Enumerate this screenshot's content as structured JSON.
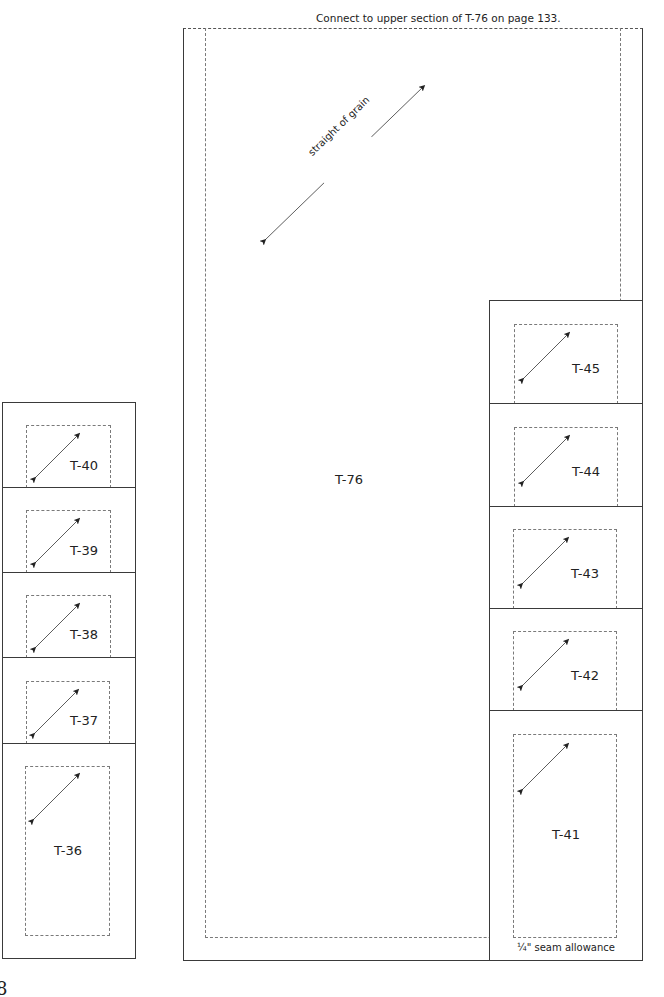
{
  "header_note": "Connect to upper section of T-76 on page 133.",
  "main_piece": {
    "label": "T-76",
    "grain_label": "straight of grain"
  },
  "right_column": [
    {
      "label": "T-45"
    },
    {
      "label": "T-44"
    },
    {
      "label": "T-43"
    },
    {
      "label": "T-42"
    },
    {
      "label": "T-41"
    }
  ],
  "left_column": [
    {
      "label": "T-40"
    },
    {
      "label": "T-39"
    },
    {
      "label": "T-38"
    },
    {
      "label": "T-37"
    },
    {
      "label": "T-36"
    }
  ],
  "seam_note": "¼\" seam allowance",
  "page_number": "8",
  "colors": {
    "outline": "#3a3a3a",
    "dashed": "#7a7a7a"
  }
}
